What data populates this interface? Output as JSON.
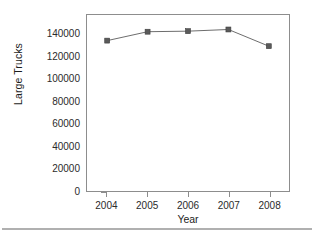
{
  "figure": {
    "background_color": "#ffffff",
    "frame_color": "#8d8d8d",
    "footer_rule_color": "#b0b0b0"
  },
  "chart_data": {
    "type": "line",
    "title": "",
    "subtitle": "",
    "xlabel": "Year",
    "ylabel": "Large Trucks",
    "categories": [
      "2004",
      "2005",
      "2006",
      "2007",
      "2008"
    ],
    "x": [
      2004,
      2005,
      2006,
      2007,
      2008
    ],
    "values": [
      135000,
      143000,
      143500,
      145000,
      130000
    ],
    "series": [
      {
        "name": "Large Trucks",
        "values": [
          135000,
          143000,
          143500,
          145000,
          130000
        ],
        "line_color": "#6b6b6b",
        "marker": "square",
        "marker_color": "#5a5a5a"
      }
    ],
    "ylim": [
      0,
      158000
    ],
    "yticks": [
      0,
      20000,
      40000,
      60000,
      80000,
      100000,
      120000,
      140000
    ],
    "ytick_labels": [
      "0",
      "20000",
      "40000",
      "60000",
      "80000",
      "100000",
      "120000",
      "140000"
    ],
    "xtick_labels": [
      "2004",
      "2005",
      "2006",
      "2007",
      "2008"
    ],
    "grid": false,
    "legend": false,
    "legend_position": "none"
  }
}
